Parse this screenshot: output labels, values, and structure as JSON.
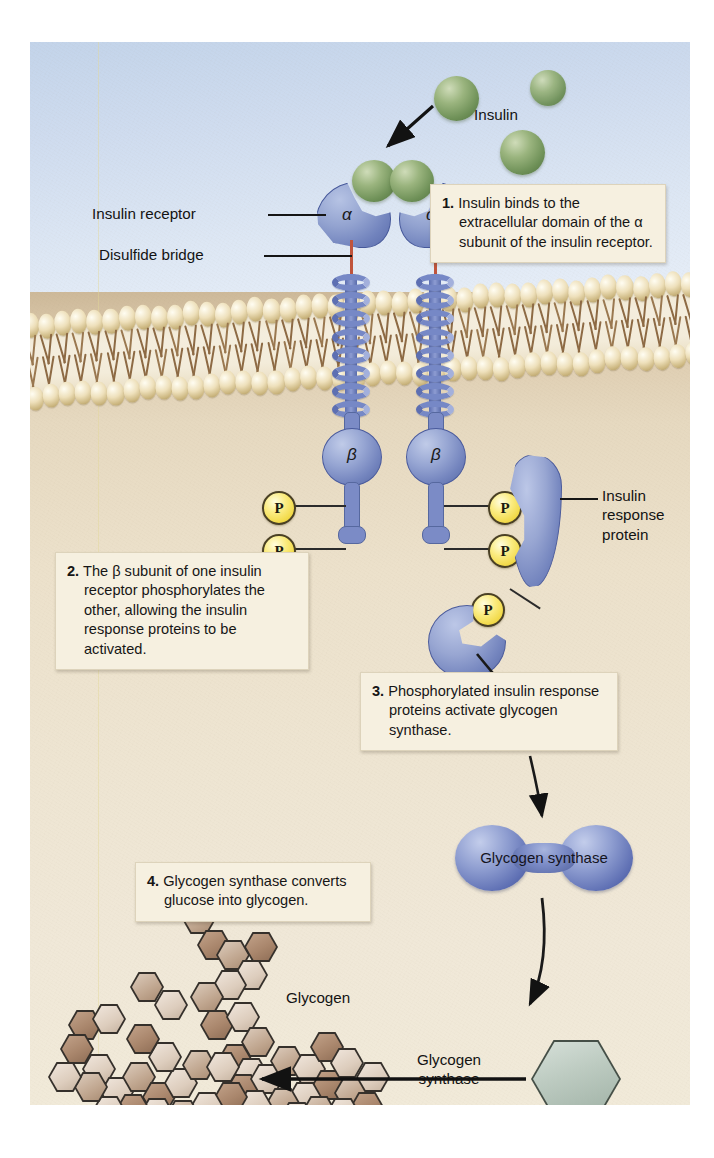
{
  "diagram": {
    "regions": {
      "extracellular_label": "",
      "cytoplasm_label": ""
    },
    "labels": {
      "insulin": "Insulin",
      "insulin_receptor": "Insulin receptor",
      "disulfide_bridge": "Disulfide bridge",
      "alpha_left": "α",
      "alpha_right": "α",
      "beta_left": "β",
      "beta_right": "β",
      "insulin_response_protein": "Insulin\nresponse\nprotein",
      "insulin_response_protein_l1": "Insulin",
      "insulin_response_protein_l2": "response",
      "insulin_response_protein_l3": "protein",
      "glycogen_synthase_enzyme": "Glycogen synthase",
      "glycogen": "Glycogen",
      "glycogen_synthase_arrow_l1": "Glycogen",
      "glycogen_synthase_arrow_l2": "synthase",
      "glucose": "Glucose",
      "phosphate": "P"
    },
    "steps": [
      {
        "number": "1.",
        "text": "Insulin binds to the extracellular domain of the α subunit of the insulin receptor."
      },
      {
        "number": "2.",
        "text": "The β subunit of one insulin receptor phosphorylates the other, allowing the insulin response proteins to be activated."
      },
      {
        "number": "3.",
        "text": "Phosphorylated insulin response proteins activate glycogen synthase."
      },
      {
        "number": "4.",
        "text": "Glycogen synthase converts glucose into glycogen."
      }
    ],
    "colors": {
      "extracellular_fluid": "#cfdcef",
      "cytoplasm": "#ece1cb",
      "membrane_head": "#d8c493",
      "membrane_tail": "#8d6a44",
      "receptor_protein": "#7283bd",
      "disulfide_bridge": "#c0543c",
      "insulin_sphere": "#6f9158",
      "phosphate_circle": "#f2da4a",
      "glycogen_synthase": "#5f70b4",
      "glucose_hexagon": "#bdcbc1",
      "glycogen_hex_light": "#ddcdbd",
      "glycogen_hex_dark": "#a9866c",
      "callout_box": "#f6f0e0"
    },
    "counts": {
      "insulin_spheres_free": 3,
      "insulin_spheres_bound": 2,
      "phosphates_on_receptors": 4,
      "phosphates_on_response_protein": 1,
      "response_proteins": 2
    }
  }
}
